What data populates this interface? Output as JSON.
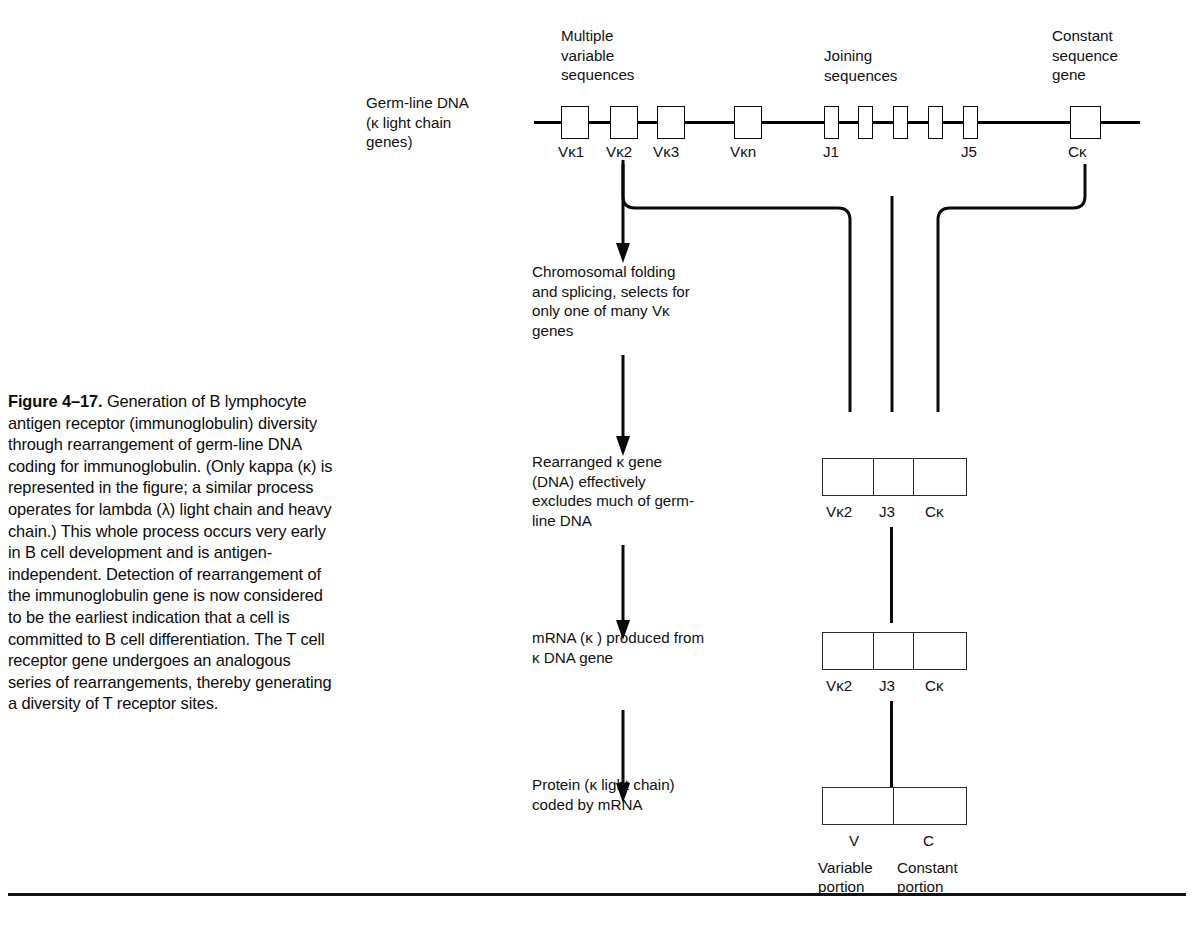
{
  "figure": {
    "label": "Figure 4–17.",
    "caption": " Generation of B lymphocyte antigen receptor (immunoglobulin) diversity through rearrangement of germ-line DNA coding for immunoglobulin. (Only kappa (κ) is represented in the figure; a similar process operates for lambda (λ) light chain and heavy chain.) This whole process occurs very early in B cell development and is antigen-independent. Detection of rearrangement of the immunoglobulin gene is now considered to be the earliest indication that a cell is committed to B cell differentiation. The T cell receptor gene undergoes an analogous series of rearrangements, thereby generating a diversity of T receptor sites."
  },
  "germline": {
    "row_label": "Germ-line DNA\n(κ light chain\ngenes)",
    "headings": {
      "variable": "Multiple\nvariable\nsequences",
      "joining": "Joining\nsequences",
      "constant": "Constant\nsequence\ngene"
    },
    "v_ticks": [
      "Vκ1",
      "Vκ2",
      "Vκ3",
      "Vκn"
    ],
    "j_ticks": [
      "J1",
      "J5"
    ],
    "c_tick": "Cκ",
    "v_box_count": 4,
    "j_box_count": 5,
    "c_box_count": 1
  },
  "stages": [
    {
      "id": "folding",
      "text": "Chromosomal folding\nand splicing, selects for\nonly one of many Vκ\ngenes"
    },
    {
      "id": "rearranged",
      "text": "Rearranged κ gene\n(DNA) effectively\nexcludes much of germ-\nline DNA",
      "segments": [
        "Vκ2",
        "J3",
        "Cκ"
      ]
    },
    {
      "id": "mrna",
      "text": "mRNA (κ ) produced from\nκ DNA gene",
      "segments": [
        "Vκ2",
        "J3",
        "Cκ"
      ]
    },
    {
      "id": "protein",
      "text": "Protein (κ light chain)\ncoded by mRNA",
      "segments": [
        "V",
        "C"
      ],
      "sublabels": [
        "Variable\nportion",
        "Constant\nportion"
      ]
    }
  ],
  "colors": {
    "ink": "#000000",
    "line": "#0a0a0a",
    "box_stroke": "#2a2a2a",
    "background": "#ffffff"
  }
}
